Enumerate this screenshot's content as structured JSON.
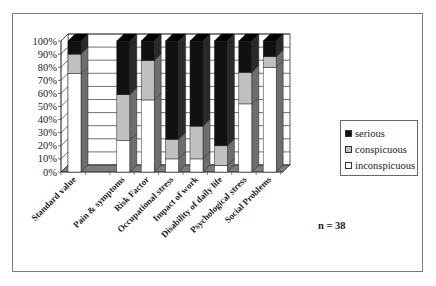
{
  "chart_data": {
    "type": "bar",
    "subtype": "stacked-100-percent-3d",
    "title": "",
    "xlabel": "",
    "ylabel": "",
    "ylim": [
      0,
      100
    ],
    "yticks": [
      "0%",
      "10%",
      "20%",
      "30%",
      "40%",
      "50%",
      "60%",
      "70%",
      "80%",
      "90%",
      "100%"
    ],
    "grid": true,
    "legend_position": "right",
    "categories": [
      "Standard value",
      "Pain & symptoms",
      "Risk Factor",
      "Occupational stress",
      "Impact of work",
      "Disability of daily life",
      "Psychological  stress",
      "Social Problems"
    ],
    "category_slots": [
      0,
      2,
      3,
      4,
      5,
      6,
      7,
      8
    ],
    "series": [
      {
        "name": "inconspicuous",
        "color": "#ffffff",
        "values": [
          75,
          24,
          55,
          10,
          10,
          5,
          52,
          80
        ]
      },
      {
        "name": "conspicuous",
        "color": "#c0c0c0",
        "values": [
          15,
          35,
          30,
          15,
          25,
          15,
          24,
          8
        ]
      },
      {
        "name": "serious",
        "color": "#111111",
        "values": [
          10,
          41,
          15,
          75,
          65,
          80,
          24,
          12
        ]
      }
    ],
    "annotations": [
      "n = 38"
    ]
  },
  "legend": {
    "items": [
      {
        "label": "serious",
        "color": "#111111"
      },
      {
        "label": "conspicuous",
        "color": "#c0c0c0"
      },
      {
        "label": "inconspicuous",
        "color": "#ffffff"
      }
    ]
  },
  "annotation": {
    "n_label": "n = 38"
  },
  "colors": {
    "side": "#6e6e6e",
    "floor": "#7c7c7c",
    "grid": "#333333",
    "frame": "#7a7a7a"
  }
}
